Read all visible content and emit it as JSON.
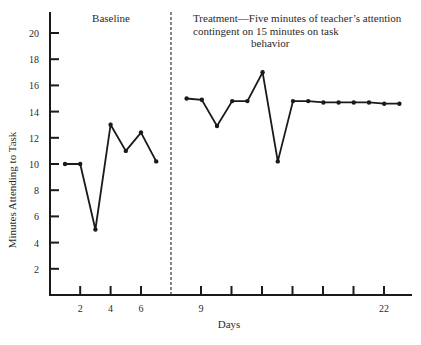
{
  "chart_data": {
    "type": "line",
    "title": "",
    "xlabel": "Days",
    "ylabel": "Minutes Attending to Task",
    "ylim": [
      0,
      21
    ],
    "xlim": [
      0,
      24
    ],
    "grid": false,
    "legend": null,
    "y_ticks": [
      2,
      4,
      6,
      8,
      10,
      12,
      14,
      16,
      18,
      20
    ],
    "x_tick_labels": [
      {
        "label": "2",
        "day": 2
      },
      {
        "label": "4",
        "day": 4
      },
      {
        "label": "6",
        "day": 6
      },
      {
        "label": "9",
        "day": 10
      },
      {
        "label": "",
        "day": 12
      },
      {
        "label": "",
        "day": 14
      },
      {
        "label": "",
        "day": 16
      },
      {
        "label": "",
        "day": 18
      },
      {
        "label": "",
        "day": 20
      },
      {
        "label": "22",
        "day": 22
      }
    ],
    "phase_divider_day": 8,
    "annotations": [
      {
        "text": "Baseline",
        "phase": "baseline"
      },
      {
        "text": "Treatment—Five minutes of teacher’s attention contingent on 15 minutes on task behavior",
        "phase": "treatment"
      }
    ],
    "series": [
      {
        "name": "Baseline",
        "x": [
          1,
          2,
          3,
          4,
          5,
          6,
          7
        ],
        "values": [
          10,
          10,
          5,
          13,
          11,
          12.4,
          10.2
        ]
      },
      {
        "name": "Treatment",
        "x": [
          9,
          10,
          11,
          12,
          13,
          14,
          15,
          16,
          17,
          18,
          19,
          20,
          21,
          22,
          23
        ],
        "values": [
          15,
          14.9,
          12.9,
          14.8,
          14.8,
          17,
          10.2,
          14.8,
          14.8,
          14.7,
          14.7,
          14.7,
          14.7,
          14.6,
          14.6
        ]
      }
    ]
  },
  "labels": {
    "baseline": "Baseline",
    "treatment_line1": "Treatment—Five minutes of teacher’s attention",
    "treatment_line2": "contingent on 15 minutes on task",
    "treatment_line3": "behavior",
    "xlabel": "Days",
    "ylabel": "Minutes Attending to Task"
  },
  "style": {
    "line_color": "#1a1a1a",
    "axis_color": "#1a1a1a"
  }
}
